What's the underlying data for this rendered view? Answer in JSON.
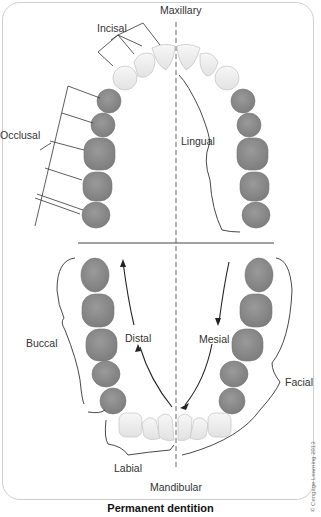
{
  "diagram": {
    "title": "Permanent dentition",
    "copyright": "© Cengage Learning 2013",
    "arches": {
      "upper": "Maxillary",
      "lower": "Mandibular"
    },
    "labels": {
      "incisal": "Incisal",
      "occlusal": "Occlusal",
      "lingual": "Lingual",
      "buccal": "Buccal",
      "distal": "Distal",
      "mesial": "Mesial",
      "facial": "Facial",
      "labial": "Labial"
    },
    "colors": {
      "anterior_teeth": "#efefef",
      "posterior_teeth": "#8a8a8a",
      "lines": "#333333",
      "midline": "#666666"
    },
    "teeth_per_quadrant": {
      "anterior": 3,
      "posterior": 5
    }
  }
}
